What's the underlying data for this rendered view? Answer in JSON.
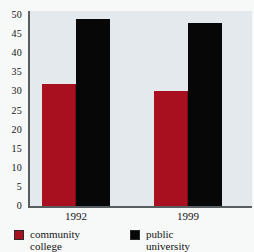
{
  "chart_data": {
    "type": "bar",
    "title": "",
    "subtitle": "",
    "xlabel": "",
    "ylabel": "",
    "categories": [
      "1992",
      "1999"
    ],
    "series": [
      {
        "name": "community college",
        "values": [
          32,
          30
        ],
        "color": "#a8101f"
      },
      {
        "name": "public university",
        "values": [
          49,
          48
        ],
        "color": "#070707"
      }
    ],
    "ylim": [
      0,
      50
    ],
    "ytick_labels": [
      "50",
      "45",
      "40",
      "35",
      "30",
      "25",
      "20",
      "15",
      "10",
      "5",
      "0"
    ],
    "ytick_values": [
      50,
      45,
      40,
      35,
      30,
      25,
      20,
      15,
      10,
      5,
      0
    ],
    "grid": false,
    "legend_position": "bottom-left",
    "annotations": []
  },
  "legend": {
    "entries": [
      {
        "label": "community\ncollege",
        "swatch": "legend-swatch-red"
      },
      {
        "label": "public\nuniversity",
        "swatch": "legend-swatch-black"
      }
    ]
  },
  "colors": {
    "community_college": "#a8101f",
    "public_university": "#070707",
    "plot_background": "#e3e9ed",
    "page_background": "#f7f8f8",
    "axis": "#585d60"
  }
}
